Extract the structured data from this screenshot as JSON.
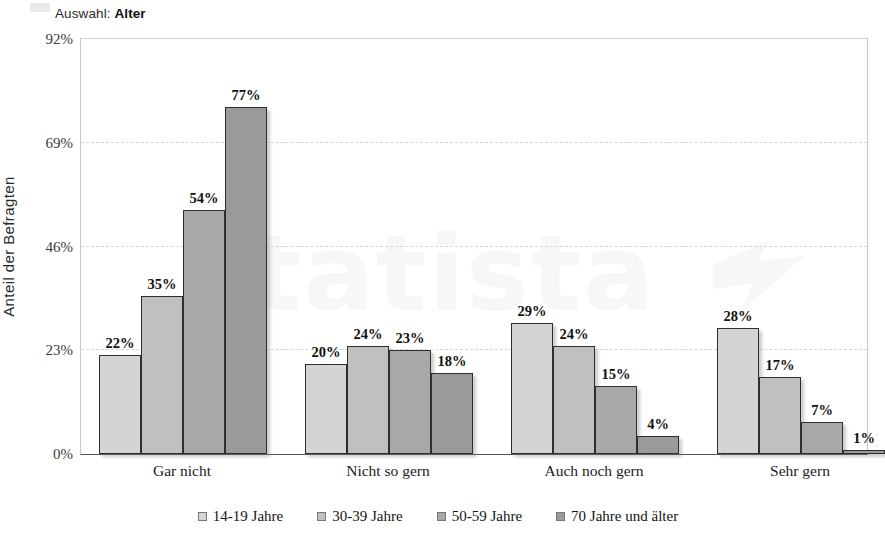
{
  "header": {
    "prefix": "Auswahl:",
    "selection": "Alter",
    "full": "Auswahl: Alter"
  },
  "watermark": {
    "text": "tatista",
    "mark": "statista-logo-mark"
  },
  "chart_data": {
    "type": "bar",
    "title": "",
    "xlabel": "",
    "ylabel": "Anteil der Befragten",
    "categories": [
      "Gar nicht",
      "Nicht so gern",
      "Auch noch gern",
      "Sehr gern"
    ],
    "ylim": [
      0,
      92
    ],
    "yticks": [
      0,
      23,
      46,
      69,
      92
    ],
    "ytick_labels": [
      "0%",
      "23%",
      "46%",
      "69%",
      "92%"
    ],
    "grid": true,
    "legend_position": "bottom",
    "value_suffix": "%",
    "series": [
      {
        "name": "14-19 Jahre",
        "color": "#d4d4d4",
        "values": [
          22,
          20,
          29,
          28
        ],
        "labels": [
          "22%",
          "20%",
          "29%",
          "28%"
        ]
      },
      {
        "name": "30-39 Jahre",
        "color": "#c0c0c0",
        "values": [
          35,
          24,
          24,
          17
        ],
        "labels": [
          "35%",
          "24%",
          "24%",
          "17%"
        ]
      },
      {
        "name": "50-59 Jahre",
        "color": "#a8a8a8",
        "values": [
          54,
          23,
          15,
          7
        ],
        "labels": [
          "54%",
          "23%",
          "15%",
          "7%"
        ]
      },
      {
        "name": "70 Jahre und älter",
        "color": "#9a9a9a",
        "values": [
          77,
          18,
          4,
          1
        ],
        "labels": [
          "77%",
          "18%",
          "4%",
          "1%"
        ]
      }
    ]
  }
}
